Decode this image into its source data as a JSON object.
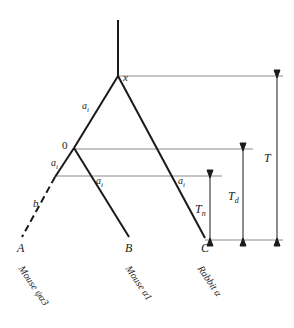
{
  "figure": {
    "type": "phylogenetic-tree-diagram",
    "background_color": "#ffffff",
    "stroke_color": "#1a1a1a",
    "guide_line_color": "#8a8a8a"
  },
  "nodes": {
    "root": "x",
    "internal": "0"
  },
  "tips": {
    "a": "A",
    "b": "B",
    "c": "C"
  },
  "taxa": {
    "a": "Mouse ψα3",
    "b": "Mouse α1",
    "c": "Rabbit α"
  },
  "branch_labels": {
    "root_left": "a",
    "root_left_sub": "i",
    "node0_left": "a",
    "node0_left_sub": "i",
    "node0_right": "a",
    "node0_right_sub": "i",
    "root_right": "a",
    "root_right_sub": "i",
    "pseudogene": "b"
  },
  "time_axes": {
    "total": "T",
    "total_sub": "",
    "duplication": "T",
    "duplication_sub": "d",
    "nonfunctional": "T",
    "nonfunctional_sub": "n"
  }
}
